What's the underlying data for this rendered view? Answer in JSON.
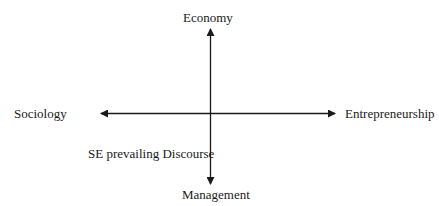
{
  "diagram": {
    "type": "quadrant-axes",
    "axes": {
      "vertical": {
        "top_label": "Economy",
        "bottom_label": "Management"
      },
      "horizontal": {
        "left_label": "Sociology",
        "right_label": "Entrepreneurship"
      }
    },
    "annotations": [
      {
        "text": "SE prevailing Discourse",
        "quadrant": "bottom-left"
      }
    ],
    "colors": {
      "line": "#1a1a1a",
      "text": "#1a1a1a",
      "background": "#ffffff"
    }
  }
}
